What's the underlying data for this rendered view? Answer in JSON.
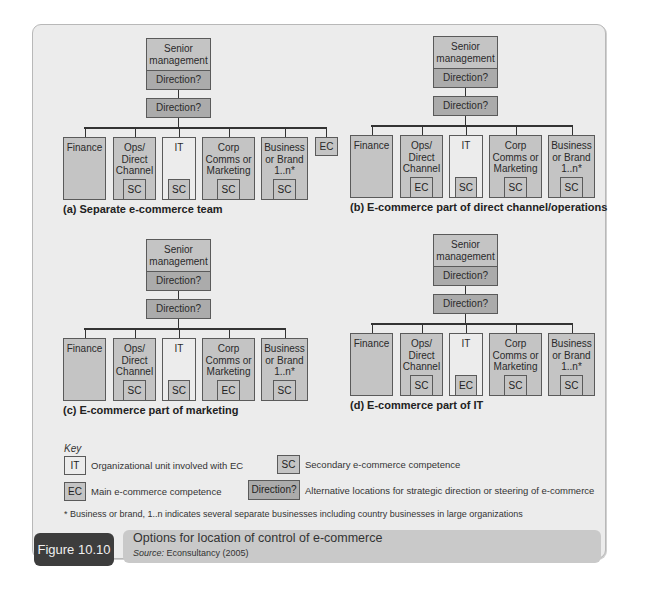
{
  "figure": {
    "label": "Figure 10.10",
    "title": "Options for location of control of e-commerce",
    "source_label": "Source:",
    "source_text": "Econsultancy (2005)"
  },
  "colors": {
    "main_unit_fill": "#c4c4c4",
    "direction_fill": "#ababab",
    "it_unit_fill": "#ececec",
    "frame_bg": "#ececec",
    "figure_label_bg": "#3d3d3d",
    "figure_bar_bg": "#c9c9c9"
  },
  "diagrams": [
    {
      "id": "a",
      "caption": "(a) Separate e-commerce team",
      "senior": "Senior management",
      "senior_direction": "Direction?",
      "direction": "Direction?",
      "units": [
        {
          "name": "Finance",
          "competence": ""
        },
        {
          "name": "Ops/ Direct Channel",
          "competence": "SC"
        },
        {
          "name": "IT",
          "competence": "SC"
        },
        {
          "name": "Corp Comms or Marketing",
          "competence": "SC"
        },
        {
          "name": "Business or Brand 1..n*",
          "competence": "SC"
        }
      ],
      "extra_unit": "EC"
    },
    {
      "id": "b",
      "caption": "(b) E-commerce part of direct channel/operations",
      "senior": "Senior management",
      "senior_direction": "Direction?",
      "direction": "Direction?",
      "units": [
        {
          "name": "Finance",
          "competence": ""
        },
        {
          "name": "Ops/ Direct Channel",
          "competence": "EC"
        },
        {
          "name": "IT",
          "competence": "SC"
        },
        {
          "name": "Corp Comms or Marketing",
          "competence": "SC"
        },
        {
          "name": "Business or Brand 1..n*",
          "competence": "SC"
        }
      ]
    },
    {
      "id": "c",
      "caption": "(c) E-commerce part of marketing",
      "senior": "Senior management",
      "senior_direction": "Direction?",
      "direction": "Direction?",
      "units": [
        {
          "name": "Finance",
          "competence": ""
        },
        {
          "name": "Ops/ Direct Channel",
          "competence": "SC"
        },
        {
          "name": "IT",
          "competence": "SC"
        },
        {
          "name": "Corp Comms or Marketing",
          "competence": "EC"
        },
        {
          "name": "Business or Brand 1..n*",
          "competence": "SC"
        }
      ]
    },
    {
      "id": "d",
      "caption": "(d) E-commerce part of IT",
      "senior": "Senior management",
      "senior_direction": "Direction?",
      "direction": "Direction?",
      "units": [
        {
          "name": "Finance",
          "competence": ""
        },
        {
          "name": "Ops/ Direct Channel",
          "competence": "SC"
        },
        {
          "name": "IT",
          "competence": "EC"
        },
        {
          "name": "Corp Comms or Marketing",
          "competence": "SC"
        },
        {
          "name": "Business or Brand 1..n*",
          "competence": "SC"
        }
      ]
    }
  ],
  "key": {
    "title": "Key",
    "items": [
      {
        "symbol": "IT",
        "text": "Organizational unit involved with EC"
      },
      {
        "symbol": "SC",
        "text": "Secondary e-commerce competence"
      },
      {
        "symbol": "EC",
        "text": "Main e-commerce competence"
      },
      {
        "symbol": "Direction?",
        "text": "Alternative locations for strategic direction or steering of e-commerce"
      }
    ],
    "footnote": "* Business or brand, 1..n indicates several separate businesses including country businesses in large organizations"
  }
}
